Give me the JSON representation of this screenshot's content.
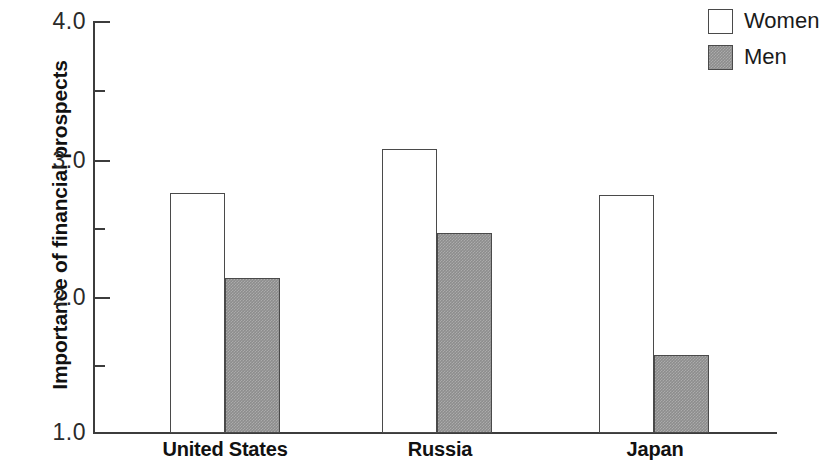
{
  "chart_data": {
    "type": "bar",
    "title": "",
    "xlabel": "",
    "ylabel": "Importance of financial prospects",
    "categories": [
      "United States",
      "Russia",
      "Japan"
    ],
    "series": [
      {
        "name": "Women",
        "values": [
          2.75,
          3.07,
          2.74
        ],
        "fill": "#ffffff"
      },
      {
        "name": "Men",
        "values": [
          2.13,
          2.46,
          1.57
        ],
        "fill": "#8d8d8d"
      }
    ],
    "ylim": [
      1.0,
      4.0
    ],
    "y_major_ticks": [
      "1.0",
      "2.0",
      "3.0",
      "4.0"
    ],
    "y_minor_ticks": [
      "1.5",
      "2.5",
      "3.5"
    ],
    "grid": false,
    "legend_position": "top-right"
  },
  "axis": {
    "y_title": "Importance of financial prospects",
    "ticks": [
      {
        "label": "4.0",
        "value": 4.0
      },
      {
        "label": "3.0",
        "value": 3.0
      },
      {
        "label": "2.0",
        "value": 2.0
      },
      {
        "label": "1.0",
        "value": 1.0
      }
    ]
  },
  "legend": {
    "items": [
      {
        "label": "Women",
        "swatch": "women-swatch"
      },
      {
        "label": "Men",
        "swatch": "men-swatch"
      }
    ]
  },
  "categories": [
    {
      "label": "United States"
    },
    {
      "label": "Russia"
    },
    {
      "label": "Japan"
    }
  ]
}
